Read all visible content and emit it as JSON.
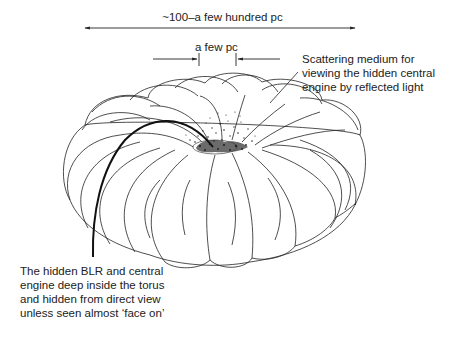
{
  "diagram": {
    "type": "AGN obscuring torus schematic",
    "dimensions": {
      "outer": {
        "label": "~100–a few hundred pc",
        "arrow": "double-headed"
      },
      "inner": {
        "label": "a few pc",
        "arrow": "converging pointers"
      }
    },
    "annotations": {
      "scattering_medium": {
        "lines": [
          "Scattering medium for",
          "viewing the hidden central",
          "engine by reflected light"
        ]
      },
      "hidden_blr": {
        "lines": [
          "The hidden BLR and central",
          "engine deep inside the torus",
          "and hidden from direct view",
          "unless seen almost ‘face on’"
        ]
      }
    },
    "colors": {
      "ink": "#1a1a1a",
      "background": "#ffffff"
    }
  }
}
